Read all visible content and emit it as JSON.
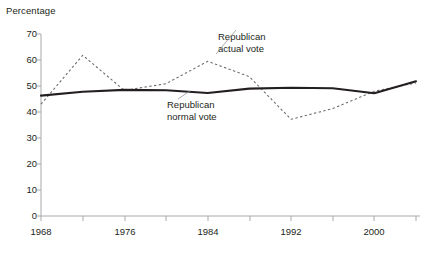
{
  "chart_data": {
    "type": "line",
    "title": "",
    "ylabel": "Percentage",
    "xlabel": "",
    "ylim": [
      0,
      70
    ],
    "ytick_step": 10,
    "yticks": [
      "0",
      "10",
      "20",
      "30",
      "40",
      "50",
      "60",
      "70"
    ],
    "xlim": [
      1968,
      2004
    ],
    "xticks_major": [
      "1968",
      "1976",
      "1984",
      "1992",
      "2000"
    ],
    "xtick_minor_step": 4,
    "grid": false,
    "legend": "inline-annotations",
    "x": [
      1968,
      1972,
      1976,
      1980,
      1984,
      1988,
      1992,
      1996,
      2000,
      2004
    ],
    "series": [
      {
        "name": "Republican normal vote",
        "style": "solid",
        "color": "#231f20",
        "values": [
          46.3,
          47.8,
          48.5,
          48.4,
          47.3,
          49.0,
          49.3,
          49.1,
          47.2,
          51.8
        ]
      },
      {
        "name": "Republican actual vote",
        "style": "dashed",
        "color": "#6d6e71",
        "values": [
          43.0,
          61.8,
          48.3,
          50.9,
          59.5,
          53.6,
          37.2,
          41.3,
          48.0,
          51.2
        ]
      }
    ],
    "annotations": [
      {
        "text_line1": "Republican",
        "text_line2": "actual vote",
        "target_year": 1983
      },
      {
        "text_line1": "Republican",
        "text_line2": "normal vote",
        "target_year": 1981
      }
    ]
  },
  "labels": {
    "y_axis_title": "Percentage",
    "y_70": "70",
    "y_60": "60",
    "y_50": "50",
    "y_40": "40",
    "y_30": "30",
    "y_20": "20",
    "y_10": "10",
    "y_0": "0",
    "x_1968": "1968",
    "x_1976": "1976",
    "x_1984": "1984",
    "x_1992": "1992",
    "x_2000": "2000",
    "actual_l1": "Republican",
    "actual_l2": "actual vote",
    "normal_l1": "Republican",
    "normal_l2": "normal vote"
  },
  "colors": {
    "axis": "#a7a9ac",
    "normal_line": "#231f20",
    "actual_line": "#6d6e71",
    "text": "#231f20"
  }
}
